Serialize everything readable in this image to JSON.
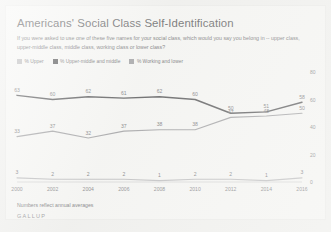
{
  "chart_title": "Americans' Social Class Self-Identification",
  "chart_subtitle": "If you were asked to use one of these five names for your social class, which would you say you belong in -- upper class, upper-middle class, middle class, working class or lower class?",
  "footnote": "Numbers reflect annual averages",
  "source": "GALLUP",
  "legend": {
    "items": [
      {
        "label": "% Upper",
        "color": "#b9b9bb"
      },
      {
        "label": "% Upper-middle and middle",
        "color": "#4c4c4e"
      },
      {
        "label": "% Working and lower",
        "color": "#9a9a9d"
      }
    ]
  },
  "axis": {
    "y_ticks": [
      "0",
      "20",
      "40",
      "60",
      "80"
    ],
    "x_ticks": [
      "2000",
      "2002",
      "2004",
      "2006",
      "2008",
      "2010",
      "2012",
      "2014",
      "2016"
    ]
  },
  "chart_data": {
    "type": "line",
    "title": "Americans' Social Class Self-Identification",
    "subtitle": "If you were asked to use one of these five names for your social class, which would you say you belong in -- upper class, upper-middle class, middle class, working class or lower class?",
    "xlabel": "",
    "ylabel": "",
    "ylim": [
      0,
      80
    ],
    "yticks": [
      0,
      20,
      40,
      60,
      80
    ],
    "grid": false,
    "legend_position": "top-left",
    "x": [
      2000,
      2002,
      2004,
      2006,
      2008,
      2010,
      2012,
      2014,
      2016
    ],
    "series": [
      {
        "name": "% Upper-middle and middle",
        "color": "#4c4c4e",
        "values": [
          63,
          60,
          62,
          61,
          62,
          60,
          50,
          51,
          58
        ],
        "labels": [
          "63",
          "60",
          "62",
          "61",
          "62",
          "60",
          "50",
          "51",
          "58"
        ]
      },
      {
        "name": "% Working and lower",
        "color": "#9a9a9d",
        "values": [
          33,
          37,
          32,
          37,
          38,
          38,
          47,
          48,
          50
        ],
        "labels": [
          "33",
          "37",
          "32",
          "37",
          "38",
          "38",
          "47",
          "48",
          "50"
        ]
      },
      {
        "name": "% Upper",
        "color": "#b9b9bb",
        "values": [
          3,
          2,
          2,
          2,
          1,
          2,
          2,
          1,
          3
        ],
        "labels": [
          "3",
          "2",
          "2",
          "2",
          "1",
          "2",
          "2",
          "1",
          "3"
        ]
      }
    ]
  }
}
